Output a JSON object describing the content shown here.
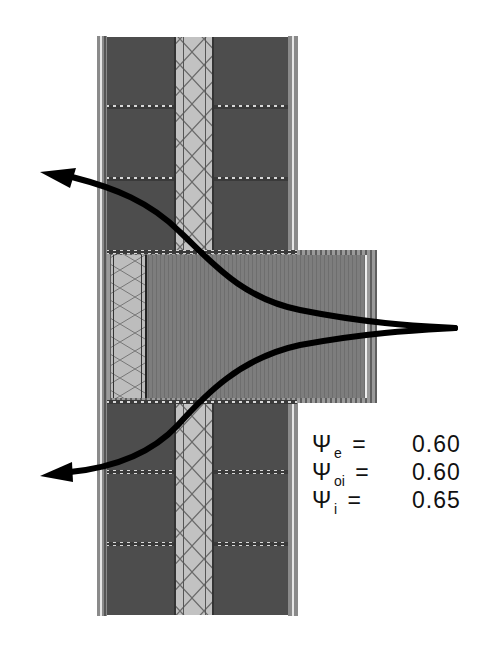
{
  "diagram": {
    "colors": {
      "background": "#ffffff",
      "masonry": "#4d4d4d",
      "mortar_joint": "#c8c8c8",
      "insulation": "#bdbdbd",
      "insulation_hatch": "#6a6a6a",
      "slab": "#7a7a7a",
      "flux_arrows": "#000000",
      "text": "#111111"
    },
    "elements": [
      "wall-outer-leaf",
      "wall-insulation-core",
      "wall-inner-leaf",
      "slab-projection",
      "slab-edge-insulation",
      "heat-flow-arrow-upper",
      "heat-flow-arrow-lower"
    ]
  },
  "legend": {
    "rows": [
      {
        "symbol": "Ψ",
        "subscript": "e",
        "equals": "=",
        "value": "0.60"
      },
      {
        "symbol": "Ψ",
        "subscript": "oi",
        "equals": "=",
        "value": "0.60"
      },
      {
        "symbol": "Ψ",
        "subscript": "i",
        "equals": "=",
        "value": "0.65"
      }
    ]
  }
}
